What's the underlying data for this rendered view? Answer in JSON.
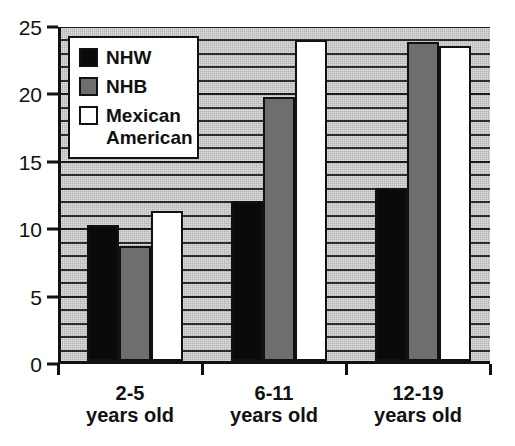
{
  "chart_data": {
    "type": "bar",
    "title": "",
    "xlabel": "",
    "ylabel": "",
    "categories": [
      "2-5\nyears old",
      "6-11\nyears old",
      "12-19\nyears old"
    ],
    "series": [
      {
        "name": "NHW",
        "color": "#0a0a0a",
        "values": [
          10.1,
          11.9,
          12.8
        ]
      },
      {
        "name": "NHB",
        "color": "#6e6e6e",
        "values": [
          8.5,
          19.6,
          23.7
        ]
      },
      {
        "name": "Mexican\nAmerican",
        "color": "#ffffff",
        "values": [
          11.1,
          23.8,
          23.4
        ]
      }
    ],
    "ylim": [
      0,
      25
    ],
    "ytick_labels": [
      "0",
      "5",
      "10",
      "15",
      "20",
      "25"
    ],
    "ytick_values": [
      0,
      5,
      10,
      15,
      20,
      25
    ],
    "minor_gridline_step": 1,
    "grid": true,
    "legend_position": "upper-left",
    "plot_background": "#b4b4b4"
  },
  "legend": {
    "entries": [
      {
        "label": "NHW"
      },
      {
        "label": "NHB"
      },
      {
        "label": "Mexican\nAmerican"
      }
    ]
  }
}
